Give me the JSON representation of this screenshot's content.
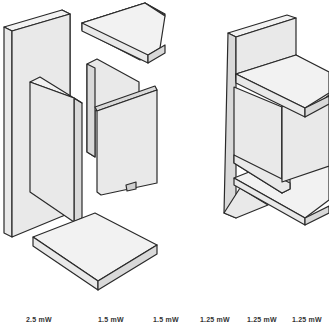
{
  "figure": {
    "exploded_view": {
      "parts": [
        {
          "id": "back-panel-tall",
          "type": "vertical panel"
        },
        {
          "id": "left-side-panel",
          "type": "vertical panel"
        },
        {
          "id": "top-slab",
          "type": "horizontal slab"
        },
        {
          "id": "middle-back-panel",
          "type": "vertical panel"
        },
        {
          "id": "front-right-panel",
          "type": "vertical panel"
        },
        {
          "id": "bottom-slab",
          "type": "horizontal slab"
        }
      ]
    },
    "assembled_view": {
      "label": "assembled unit"
    },
    "colors": {
      "face_front": "#e9e9e9",
      "face_top": "#f2f2f2",
      "face_side": "#d9d9d9",
      "outline": "#2a2a2a",
      "label_text": "#333333"
    }
  },
  "power_labels": [
    {
      "text": "2.5 mW",
      "x": 26
    },
    {
      "text": "1.5 mW",
      "x": 98
    },
    {
      "text": "1.5 mW",
      "x": 153
    },
    {
      "text": "1.25 mW",
      "x": 200
    },
    {
      "text": "1.25 mW",
      "x": 247
    },
    {
      "text": "1.25 mW",
      "x": 292
    }
  ]
}
